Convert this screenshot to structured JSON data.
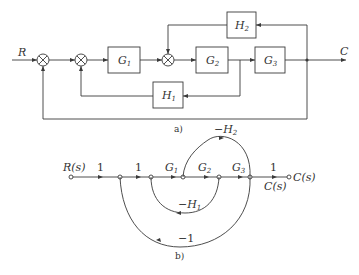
{
  "diagram_a": {
    "label": "a)",
    "input_label": "R",
    "output_label": "C",
    "blocks": [
      {
        "id": "G1",
        "name": "G",
        "sub": "1"
      },
      {
        "id": "G2",
        "name": "G",
        "sub": "2"
      },
      {
        "id": "G3",
        "name": "G",
        "sub": "3"
      },
      {
        "id": "H1",
        "name": "H",
        "sub": "1"
      },
      {
        "id": "H2",
        "name": "H",
        "sub": "2"
      }
    ],
    "summing_junctions": 3
  },
  "diagram_b": {
    "label": "b)",
    "input_node_label": "R(s)",
    "output_node_label": "C(s)",
    "output_branch_label": "C(s)",
    "branch_gains": {
      "b1": "1",
      "b2": "1",
      "g1": {
        "name": "G",
        "sub": "1"
      },
      "g2": {
        "name": "G",
        "sub": "2"
      },
      "g3": {
        "name": "G",
        "sub": "3"
      },
      "b_out": "1",
      "loop_h2": {
        "prefix": "−H",
        "sub": "2"
      },
      "loop_h1": {
        "prefix": "−H",
        "sub": "1"
      },
      "loop_outer": "−1"
    }
  }
}
